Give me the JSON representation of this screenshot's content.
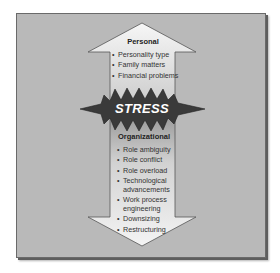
{
  "diagram": {
    "type": "stress-sources-arrows",
    "personal": {
      "heading": "Personal",
      "items": [
        "Personality type",
        "Family matters",
        "Financial problems"
      ]
    },
    "center": {
      "label": "STRESS"
    },
    "organizational": {
      "heading": "Organizational",
      "items": [
        "Role ambiguity",
        "Role conflict",
        "Role overload",
        "Technological advancements",
        "Work process engineering",
        "Downsizing",
        "Restructuring"
      ],
      "items_display": [
        [
          "Role ambiguity"
        ],
        [
          "Role conflict"
        ],
        [
          "Role overload"
        ],
        [
          "Technological",
          "advancements"
        ],
        [
          "Work process",
          "engineering"
        ],
        [
          "Downsizing"
        ],
        [
          "Restructuring"
        ]
      ]
    },
    "colors": {
      "frame": "#b9b9b9",
      "arrow_light": "#f2f2f2",
      "arrow_dark": "#a8a8a8",
      "starburst": "#3a3a3a",
      "stress_text": "#ffffff"
    }
  }
}
